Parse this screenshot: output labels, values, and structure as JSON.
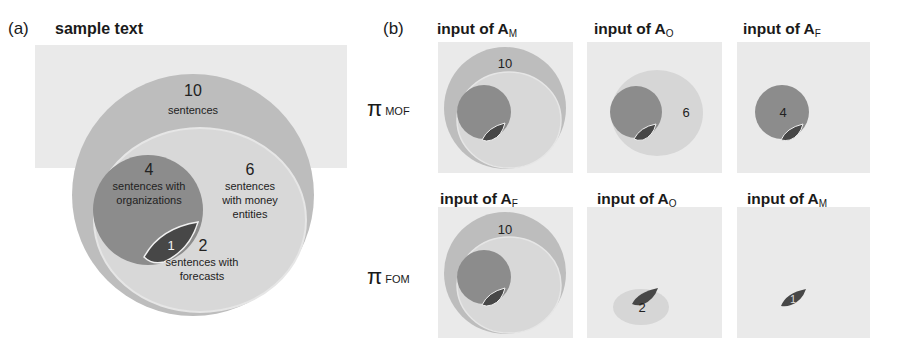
{
  "panel_a": {
    "label": "(a)",
    "title": "sample text",
    "regions": {
      "all": {
        "count": "10",
        "label_line1": "sentences"
      },
      "organizations": {
        "count": "4",
        "label_line1": "sentences with",
        "label_line2": "organizations"
      },
      "money": {
        "count": "6",
        "label_line1": "sentences",
        "label_line2": "with money",
        "label_line3": "entities"
      },
      "overlap": {
        "count": "1"
      },
      "forecasts": {
        "count": "2",
        "label_line1": "sentences with",
        "label_line2": "forecasts"
      }
    }
  },
  "panel_b": {
    "label": "(b)",
    "rows": [
      {
        "label_main": "π",
        "label_sub": "MOF",
        "cells": [
          {
            "title": "input of A",
            "subscript": "M",
            "count": "10"
          },
          {
            "title": "input of A",
            "subscript": "O",
            "count": "6"
          },
          {
            "title": "input of A",
            "subscript": "F",
            "count": "4"
          }
        ]
      },
      {
        "label_main": "π",
        "label_sub": "FOM",
        "cells": [
          {
            "title": "input of A",
            "subscript": "F",
            "count": "10"
          },
          {
            "title": "input of A",
            "subscript": "O",
            "count": "2"
          },
          {
            "title": "input of A",
            "subscript": "M",
            "count": "1"
          }
        ]
      }
    ]
  },
  "colors": {
    "background_box": "#eaeaea",
    "outer_ring": "#bdbdbd",
    "money_region": "#d6d6d6",
    "organizations": "#8c8c8c",
    "overlap": "#4a4a4a",
    "forecast_region": "#cfcfcf"
  }
}
